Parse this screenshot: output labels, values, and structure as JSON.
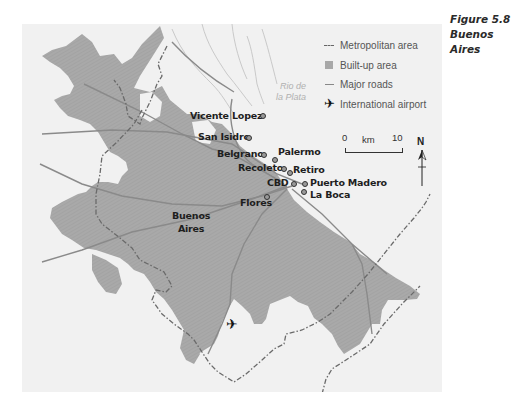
{
  "figure": {
    "number": "Figure 5.8",
    "title": "Buenos Aires"
  },
  "legend": {
    "items": [
      {
        "symbol": "dash-dot-line",
        "label": "Metropolitan area"
      },
      {
        "symbol": "gray-square",
        "label": "Built-up area"
      },
      {
        "symbol": "solid-line",
        "label": "Major roads"
      },
      {
        "symbol": "airplane-icon",
        "label": "International airport"
      }
    ]
  },
  "water_label": {
    "line1": "Rio de",
    "line2": "la Plata"
  },
  "scale": {
    "start": "0",
    "unit": "km",
    "end": "10"
  },
  "north_arrow": {
    "label": "N"
  },
  "places": [
    {
      "name": "Vicente Lopez"
    },
    {
      "name": "San Isidro"
    },
    {
      "name": "Belgrano"
    },
    {
      "name": "Palermo"
    },
    {
      "name": "Recoleto"
    },
    {
      "name": "Retiro"
    },
    {
      "name": "CBD"
    },
    {
      "name": "Puerto Madero"
    },
    {
      "name": "La Boca"
    },
    {
      "name": "Flores"
    }
  ],
  "city_label": {
    "line1": "Buenos",
    "line2": "Aires"
  },
  "colors": {
    "background": "#f1f1f1",
    "built_up": "#a8a8a8",
    "roads": "#888888",
    "boundary": "#666666",
    "text": "#1e1e1e"
  }
}
